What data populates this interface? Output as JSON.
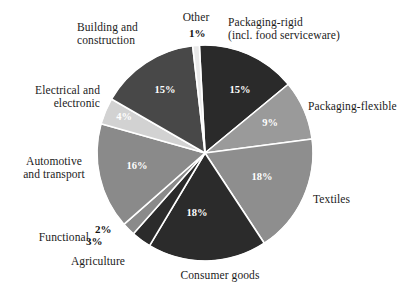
{
  "chart_data": {
    "type": "pie",
    "title": "",
    "subtitle": "",
    "xlabel": "",
    "ylabel": "",
    "legend_position": "outside-labels",
    "grid": false,
    "units": "percent",
    "total": 101,
    "start_angle_deg": -3,
    "direction": "clockwise",
    "categories": [
      "Packaging-rigid (incl. food serviceware)",
      "Packaging-flexible",
      "Textiles",
      "Consumer goods",
      "Agriculture",
      "Functional",
      "Automotive and transport",
      "Electrical and electronic",
      "Building and construction",
      "Other"
    ],
    "values": [
      15,
      9,
      18,
      18,
      3,
      2,
      16,
      4,
      15,
      1
    ],
    "slices": [
      {
        "key": "packaging-rigid",
        "label": "Packaging-rigid\n(incl. food serviceware)",
        "label_plain": "Packaging-rigid (incl. food serviceware)",
        "value": 15,
        "pct_text": "15%",
        "color": "#2a2a2a",
        "label_align": "left",
        "label_left": 228,
        "label_top": 16,
        "label_width": 185,
        "pct_inside": true,
        "pct_x": 240,
        "pct_y": 93,
        "pct_color": "#ffffff"
      },
      {
        "key": "packaging-flexible",
        "label": "Packaging-flexible",
        "label_plain": "Packaging-flexible",
        "value": 9,
        "pct_text": "9%",
        "color": "#9a9a9a",
        "label_align": "left",
        "label_left": 308,
        "label_top": 100,
        "label_width": 108,
        "pct_inside": true,
        "pct_x": 270,
        "pct_y": 126,
        "pct_color": "#ffffff"
      },
      {
        "key": "textiles",
        "label": "Textiles",
        "label_plain": "Textiles",
        "value": 18,
        "pct_text": "18%",
        "color": "#8e8e8e",
        "label_align": "left",
        "label_left": 313,
        "label_top": 193,
        "label_width": 70,
        "pct_inside": true,
        "pct_x": 262,
        "pct_y": 180,
        "pct_color": "#ffffff"
      },
      {
        "key": "consumer-goods",
        "label": "Consumer goods",
        "label_plain": "Consumer goods",
        "value": 18,
        "pct_text": "18%",
        "color": "#2b2b2b",
        "label_align": "center",
        "label_left": 150,
        "label_top": 269,
        "label_width": 140,
        "pct_inside": true,
        "pct_x": 197,
        "pct_y": 216,
        "pct_color": "#ffffff"
      },
      {
        "key": "agriculture",
        "label": "Agriculture",
        "label_plain": "Agriculture",
        "value": 3,
        "pct_text": "3%",
        "color": "#2b2b2b",
        "label_align": "center",
        "label_left": 50,
        "label_top": 255,
        "label_width": 96,
        "pct_inside": false,
        "pct_x": 86,
        "pct_y": 235,
        "pct_color": "#111111"
      },
      {
        "key": "functional",
        "label": "Functional",
        "label_plain": "Functional",
        "value": 2,
        "pct_text": "2%",
        "color": "#8a8a8a",
        "label_align": "right",
        "label_left": 14,
        "label_top": 231,
        "label_width": 75,
        "pct_inside": false,
        "pct_x": 95,
        "pct_y": 223,
        "pct_color": "#111111"
      },
      {
        "key": "automotive-and-transport",
        "label": "Automotive\nand transport",
        "label_plain": "Automotive and transport",
        "value": 16,
        "pct_text": "16%",
        "color": "#8a8a8a",
        "label_align": "center",
        "label_left": 6,
        "label_top": 155,
        "label_width": 96,
        "pct_inside": true,
        "pct_x": 137,
        "pct_y": 169,
        "pct_color": "#ffffff"
      },
      {
        "key": "electrical-and-electronic",
        "label": "Electrical and\nelectronic",
        "label_plain": "Electrical and electronic",
        "value": 4,
        "pct_text": "4%",
        "color": "#d2d2d2",
        "label_align": "right",
        "label_left": 8,
        "label_top": 84,
        "label_width": 92,
        "pct_inside": true,
        "pct_x": 124,
        "pct_y": 120,
        "pct_color": "#ffffff"
      },
      {
        "key": "building-and-construction",
        "label": "Building and\nconstruction",
        "label_plain": "Building and construction",
        "value": 15,
        "pct_text": "15%",
        "color": "#484848",
        "label_align": "left",
        "label_left": 77,
        "label_top": 21,
        "label_width": 100,
        "pct_inside": true,
        "pct_x": 165,
        "pct_y": 93,
        "pct_color": "#ffffff"
      },
      {
        "key": "other",
        "label": "Other",
        "label_plain": "Other",
        "value": 1,
        "pct_text": "1%",
        "color": "#e8e8e8",
        "label_align": "center",
        "label_left": 166,
        "label_top": 11,
        "label_width": 60,
        "pct_inside": false,
        "pct_x": 189,
        "pct_y": 27,
        "pct_color": "#111111"
      }
    ],
    "geometry": {
      "center_x": 205,
      "center_y": 153,
      "radius": 108,
      "slice_border_color": "#ffffff",
      "slice_border_width": 1.6,
      "background": "#ffffff"
    }
  }
}
